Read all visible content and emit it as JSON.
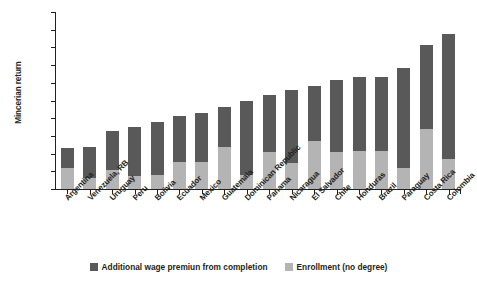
{
  "chart_data": {
    "type": "bar",
    "subtype": "stacked-vertical",
    "title": "",
    "xlabel": "",
    "ylabel": "Mincerian return",
    "ylim": [
      0,
      2.0
    ],
    "yticks": [
      "0",
      "0.2",
      "0.4",
      "0.6",
      "0.8",
      "1.0",
      "1.2",
      "1.4",
      "1.6",
      "1.8",
      "2.0"
    ],
    "grid": false,
    "legend_position": "bottom-center",
    "categories": [
      "Argentina",
      "Venezuela, RB",
      "Uruguay",
      "Peru",
      "Bolivia",
      "Ecuador",
      "Mexico",
      "Guatemala",
      "Dominican Republic",
      "Panama",
      "Nicaragua",
      "El Salvador",
      "Chile",
      "Honduras",
      "Brazil",
      "Paraguay",
      "Costa Rica",
      "Colombia"
    ],
    "series": [
      {
        "name": "Enrollment (no degree)",
        "color": "#b4b4b4",
        "stack_order": "bottom",
        "values": [
          0.24,
          0.13,
          0.21,
          0.15,
          0.16,
          0.3,
          0.31,
          0.47,
          0.16,
          0.42,
          0.29,
          0.54,
          0.42,
          0.43,
          0.43,
          0.24,
          0.68,
          0.34
        ]
      },
      {
        "name": "Additional wage premiun from completion",
        "color": "#595959",
        "stack_order": "top",
        "values": [
          0.22,
          0.34,
          0.45,
          0.55,
          0.6,
          0.52,
          0.55,
          0.46,
          0.84,
          0.64,
          0.83,
          0.62,
          0.81,
          0.84,
          0.84,
          1.13,
          0.95,
          1.41
        ]
      }
    ],
    "totals": [
      0.46,
      0.47,
      0.66,
      0.7,
      0.76,
      0.82,
      0.86,
      0.93,
      1.0,
      1.06,
      1.12,
      1.16,
      1.23,
      1.27,
      1.27,
      1.37,
      1.63,
      1.75
    ]
  },
  "legend": {
    "items": [
      {
        "label": "Additional wage premiun from completion",
        "color": "#595959"
      },
      {
        "label": "Enrollment (no degree)",
        "color": "#b4b4b4"
      }
    ]
  },
  "colors": {
    "dark_segment": "#595959",
    "light_segment": "#b4b4b4",
    "axis": "#231f20",
    "background": "#ffffff"
  }
}
